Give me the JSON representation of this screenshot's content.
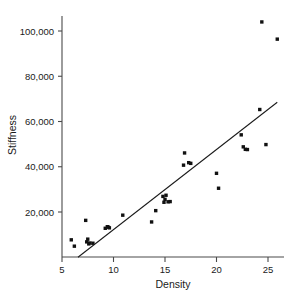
{
  "chart_data": {
    "type": "scatter",
    "title": "",
    "xlabel": "Density",
    "ylabel": "Stiffness",
    "xlim": [
      5,
      27
    ],
    "ylim": [
      0,
      108000
    ],
    "grid": false,
    "legend": null,
    "xticks": [
      5,
      10,
      15,
      20,
      25
    ],
    "xtick_labels": [
      "5",
      "10",
      "15",
      "20",
      "25"
    ],
    "yticks": [
      20000,
      40000,
      60000,
      80000,
      100000
    ],
    "ytick_labels": [
      "20,000",
      "40,000",
      "60,000",
      "80,000",
      "100,000"
    ],
    "marker": "square",
    "marker_color": "#111111",
    "x": [
      5.9,
      6.2,
      7.3,
      7.4,
      7.5,
      7.6,
      7.7,
      8.0,
      9.2,
      9.4,
      9.5,
      9.6,
      10.9,
      13.7,
      14.1,
      14.8,
      14.9,
      15.0,
      15.1,
      15.3,
      15.5,
      16.8,
      16.9,
      17.3,
      17.5,
      20.0,
      20.2,
      22.4,
      22.6,
      22.8,
      23.0,
      24.2,
      24.4,
      24.8,
      25.9
    ],
    "y": [
      7700,
      4900,
      16300,
      6800,
      8000,
      5900,
      6300,
      6200,
      12800,
      13500,
      13300,
      13000,
      18600,
      15600,
      20600,
      26900,
      24300,
      25600,
      27400,
      24500,
      24600,
      40700,
      46100,
      41800,
      41500,
      37100,
      30500,
      54100,
      48800,
      47700,
      47600,
      65300,
      104000,
      49800,
      96400
    ],
    "series": [
      {
        "name": "observations",
        "type": "scatter",
        "x": [
          5.9,
          6.2,
          7.3,
          7.4,
          7.5,
          7.6,
          7.7,
          8.0,
          9.2,
          9.4,
          9.5,
          9.6,
          10.9,
          13.7,
          14.1,
          14.8,
          14.9,
          15.0,
          15.1,
          15.3,
          15.5,
          16.8,
          16.9,
          17.3,
          17.5,
          20.0,
          20.2,
          22.4,
          22.6,
          22.8,
          23.0,
          24.2,
          24.4,
          24.8,
          25.9
        ],
        "y": [
          7700,
          4900,
          16300,
          6800,
          8000,
          5900,
          6300,
          6200,
          12800,
          13500,
          13300,
          13000,
          18600,
          15600,
          20600,
          26900,
          24300,
          25600,
          27400,
          24500,
          24600,
          40700,
          46100,
          41800,
          41500,
          37100,
          30500,
          54100,
          48800,
          47700,
          47600,
          65300,
          104000,
          49800,
          96400
        ]
      },
      {
        "name": "fitted-line",
        "type": "line",
        "x": [
          6.55,
          25.9
        ],
        "y": [
          0,
          68500
        ]
      }
    ],
    "annotations": []
  },
  "axes": {
    "x_title": "Density",
    "y_title": "Stiffness"
  }
}
